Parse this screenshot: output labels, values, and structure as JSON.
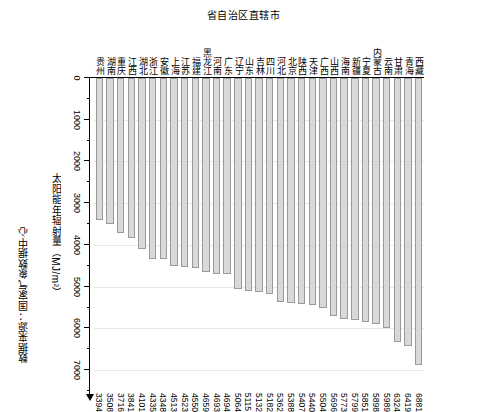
{
  "source_note": "数据来源：国家气象数据中心",
  "value_axis": {
    "title_text": "太阳能年辐射量（MJ/m²）",
    "ticks": [
      0,
      1000,
      2000,
      3000,
      4000,
      5000,
      6000,
      7000
    ],
    "min": 0,
    "max": 7500
  },
  "category_axis": {
    "title": "省自治区直辖市"
  },
  "chart_data": {
    "type": "bar",
    "title": "",
    "xlabel": "省自治区直辖市",
    "ylabel": "太阳能年辐射量（MJ/m²）",
    "ylim": [
      0,
      7500
    ],
    "grid": true,
    "legend": "none",
    "orientation": "vertical",
    "categories": [
      "西藏",
      "青海",
      "甘肃",
      "云南",
      "内蒙古",
      "宁夏",
      "新疆",
      "海南",
      "山西",
      "广西",
      "天津",
      "陕西",
      "北京",
      "河北",
      "四川",
      "吉林",
      "山东",
      "辽宁",
      "广东",
      "河南",
      "黑龙江",
      "福建",
      "江苏",
      "上海",
      "安徽",
      "浙江",
      "湖北",
      "江西",
      "重庆",
      "湖南",
      "贵州"
    ],
    "values": [
      6881,
      6419,
      6324,
      5989,
      5898,
      5851,
      5799,
      5773,
      5696,
      5504,
      5440,
      5407,
      5388,
      5362,
      5182,
      5132,
      5115,
      5064,
      4694,
      4693,
      4659,
      4550,
      4523,
      4513,
      4348,
      4335,
      4101,
      3841,
      3716,
      3508,
      3394
    ],
    "bar_fill_color": "#d9d9d9",
    "bar_border_color": "#9a9a9a",
    "gridline_color": "#e8e8e8",
    "axis_color": "#000000"
  }
}
